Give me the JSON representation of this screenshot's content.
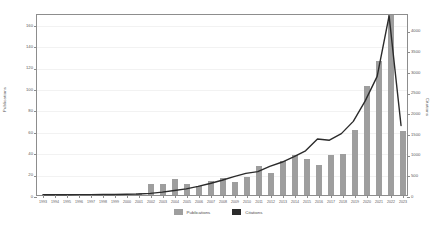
{
  "chart_data": {
    "type": "bar",
    "title": "",
    "subtitle": "",
    "xlabel": "",
    "ylabel": "Publications",
    "y2label": "Citations",
    "ylim": [
      0,
      170
    ],
    "y2lim": [
      0,
      4400
    ],
    "grid": true,
    "legend_position": "bottom-center",
    "yticks": [
      0,
      20,
      40,
      60,
      80,
      100,
      120,
      140,
      160
    ],
    "y2ticks": [
      0,
      500,
      1000,
      1500,
      2000,
      2500,
      3000,
      3500,
      4000
    ],
    "categories": [
      "1993",
      "1994",
      "1995",
      "1996",
      "1997",
      "1998",
      "1999",
      "2000",
      "2001",
      "2002",
      "2003",
      "2004",
      "2005",
      "2006",
      "2007",
      "2008",
      "2009",
      "2010",
      "2011",
      "2012",
      "2013",
      "2014",
      "2015",
      "2016",
      "2017",
      "2018",
      "2019",
      "2020",
      "2021",
      "2022",
      "2023"
    ],
    "series": [
      {
        "name": "Publications",
        "kind": "bar",
        "axis": "left",
        "color": "#9e9e9e",
        "values": [
          0,
          0,
          0,
          1,
          0,
          1,
          0,
          0,
          2,
          10,
          10,
          15,
          10,
          8,
          13,
          16,
          12,
          17,
          27,
          21,
          32,
          37,
          34,
          28,
          37,
          38,
          61,
          102,
          125,
          168,
          60
        ]
      },
      {
        "name": "Citations",
        "kind": "line",
        "axis": "right",
        "color": "#2b2b2b",
        "values": [
          5,
          5,
          6,
          8,
          10,
          12,
          14,
          18,
          25,
          40,
          70,
          110,
          150,
          210,
          280,
          360,
          450,
          530,
          570,
          700,
          800,
          930,
          1080,
          1370,
          1340,
          1500,
          1800,
          2300,
          2900,
          4380,
          1700
        ]
      }
    ],
    "legend": [
      {
        "label": "Publications",
        "color": "#9e9e9e"
      },
      {
        "label": "Citations",
        "color": "#2b2b2b"
      }
    ]
  }
}
